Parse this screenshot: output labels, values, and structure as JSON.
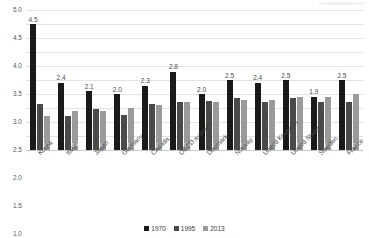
{
  "chart_data": {
    "type": "bar",
    "title": "",
    "xlabel": "",
    "ylabel": "",
    "ylim": [
      0.0,
      5.0
    ],
    "ytick_step": 0.5,
    "grid": true,
    "legend_position": "bottom-center",
    "categories": [
      "Korea",
      "Italy",
      "Japan",
      "Germany",
      "Canada",
      "OECD average",
      "Denmark",
      "Norway",
      "United Kingdom",
      "United States",
      "Sweden",
      "France"
    ],
    "yticks": [
      "0.0",
      "0.5",
      "1.0",
      "1.5",
      "2.0",
      "2.5",
      "3.0",
      "3.5",
      "4.0",
      "4.5",
      "5.0"
    ],
    "series": [
      {
        "name": "1970",
        "color": "#1a1a1a",
        "values": [
          4.5,
          2.4,
          2.1,
          2.0,
          2.3,
          2.8,
          2.0,
          2.5,
          2.4,
          2.5,
          1.9,
          2.5
        ],
        "labels": [
          "4.5",
          "2.4",
          "2.1",
          "2.0",
          "2.3",
          "2.8",
          "2.0",
          "2.5",
          "2.4",
          "2.5",
          "1.9",
          "2.5"
        ]
      },
      {
        "name": "1995",
        "color": "#4a4a4a",
        "values": [
          1.65,
          1.2,
          1.45,
          1.25,
          1.65,
          1.7,
          1.75,
          1.85,
          1.7,
          1.85,
          1.7,
          1.7
        ],
        "labels": [
          "",
          "",
          "",
          "",
          "",
          "",
          "",
          "",
          "",
          "",
          "",
          ""
        ]
      },
      {
        "name": "2013",
        "color": "#9a9a9a",
        "values": [
          1.2,
          1.4,
          1.4,
          1.5,
          1.6,
          1.7,
          1.7,
          1.8,
          1.8,
          1.9,
          1.9,
          2.0
        ],
        "labels": [
          "1.2",
          "1.4",
          "1.4",
          "1.5",
          "1.6",
          "1.7",
          "1.7",
          "1.8",
          "1.8",
          "1.9",
          "1.9",
          "2.0"
        ]
      }
    ]
  }
}
